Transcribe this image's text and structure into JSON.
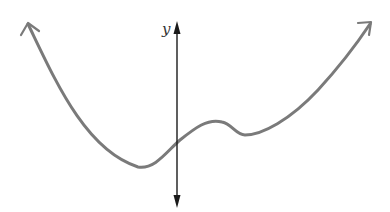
{
  "figure": {
    "axis": {
      "label": "y",
      "color": "#1a1a1a"
    },
    "curve": {
      "color": "#7a7a7a",
      "left_end_behavior": "rises to upper left (arrow)",
      "right_end_behavior": "rises to upper right (arrow)"
    }
  }
}
